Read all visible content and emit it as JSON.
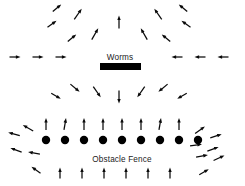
{
  "figure": {
    "width": 245,
    "height": 186,
    "background_color": "#ffffff",
    "ink_color": "#000000"
  },
  "labels": {
    "worms": "Worms",
    "obstacle_fence": "Obstacle Fence"
  },
  "worms_bar": {
    "name": "worms-bar",
    "x": 100,
    "y": 63,
    "width": 41,
    "height": 7,
    "color": "#000000"
  },
  "worms_label_pos": {
    "x": 120,
    "y": 60
  },
  "fence": {
    "label_pos": {
      "x": 122,
      "y": 162
    },
    "dot_radius": 4.2,
    "dot_y": 140,
    "dot_color": "#000000",
    "dot_count": 9,
    "dot_x": [
      46,
      65,
      84,
      103,
      122,
      141,
      160,
      179,
      198
    ]
  },
  "vectors": {
    "arrow_head_length": 4.6,
    "arrow_head_width": 3.4,
    "worms_field": [
      {
        "x": 15,
        "y": 57,
        "angle": 0,
        "len": 11
      },
      {
        "x": 38,
        "y": 57,
        "angle": 0,
        "len": 11
      },
      {
        "x": 61,
        "y": 57,
        "angle": 0,
        "len": 11
      },
      {
        "x": 177,
        "y": 57,
        "angle": 180,
        "len": 11
      },
      {
        "x": 200,
        "y": 57,
        "angle": 180,
        "len": 11
      },
      {
        "x": 223,
        "y": 57,
        "angle": 180,
        "len": 11
      },
      {
        "x": 119,
        "y": 22,
        "angle": 90,
        "len": 13
      },
      {
        "x": 95,
        "y": 34,
        "angle": 60,
        "len": 13
      },
      {
        "x": 144,
        "y": 34,
        "angle": 120,
        "len": 13
      },
      {
        "x": 72,
        "y": 38,
        "angle": 40,
        "len": 11
      },
      {
        "x": 166,
        "y": 38,
        "angle": 140,
        "len": 11
      },
      {
        "x": 78,
        "y": 14,
        "angle": 55,
        "len": 13
      },
      {
        "x": 158,
        "y": 14,
        "angle": 125,
        "len": 13
      },
      {
        "x": 52,
        "y": 24,
        "angle": 35,
        "len": 11
      },
      {
        "x": 186,
        "y": 24,
        "angle": 145,
        "len": 11
      },
      {
        "x": 183,
        "y": 8,
        "angle": 140,
        "len": 11
      },
      {
        "x": 57,
        "y": 8,
        "angle": 40,
        "len": 11
      },
      {
        "x": 119,
        "y": 97,
        "angle": -90,
        "len": 13
      },
      {
        "x": 97,
        "y": 92,
        "angle": -55,
        "len": 13
      },
      {
        "x": 141,
        "y": 92,
        "angle": -125,
        "len": 13
      },
      {
        "x": 75,
        "y": 88,
        "angle": -40,
        "len": 12
      },
      {
        "x": 163,
        "y": 88,
        "angle": -140,
        "len": 12
      },
      {
        "x": 56,
        "y": 96,
        "angle": -30,
        "len": 11
      },
      {
        "x": 182,
        "y": 96,
        "angle": -150,
        "len": 11
      }
    ],
    "fence_field": [
      {
        "x": 46,
        "y": 124,
        "angle": 90,
        "len": 12
      },
      {
        "x": 65,
        "y": 124,
        "angle": 80,
        "len": 12
      },
      {
        "x": 84,
        "y": 124,
        "angle": 90,
        "len": 12
      },
      {
        "x": 103,
        "y": 124,
        "angle": 90,
        "len": 12
      },
      {
        "x": 122,
        "y": 124,
        "angle": 90,
        "len": 12
      },
      {
        "x": 141,
        "y": 124,
        "angle": 90,
        "len": 12
      },
      {
        "x": 160,
        "y": 124,
        "angle": 80,
        "len": 12
      },
      {
        "x": 179,
        "y": 124,
        "angle": 90,
        "len": 12
      },
      {
        "x": 28,
        "y": 128,
        "angle": 150,
        "len": 12
      },
      {
        "x": 14,
        "y": 134,
        "angle": 165,
        "len": 12
      },
      {
        "x": 200,
        "y": 130,
        "angle": 35,
        "len": 12
      },
      {
        "x": 216,
        "y": 136,
        "angle": 18,
        "len": 12
      },
      {
        "x": 196,
        "y": 145,
        "angle": 8,
        "len": 12
      },
      {
        "x": 213,
        "y": 149,
        "angle": 20,
        "len": 12
      },
      {
        "x": 34,
        "y": 153,
        "angle": 170,
        "len": 12
      },
      {
        "x": 16,
        "y": 150,
        "angle": 160,
        "len": 12
      },
      {
        "x": 202,
        "y": 156,
        "angle": 10,
        "len": 12
      },
      {
        "x": 219,
        "y": 158,
        "angle": 25,
        "len": 12
      },
      {
        "x": 36,
        "y": 170,
        "angle": 145,
        "len": 11
      },
      {
        "x": 60,
        "y": 173,
        "angle": 90,
        "len": 11
      },
      {
        "x": 82,
        "y": 173,
        "angle": 90,
        "len": 11
      },
      {
        "x": 104,
        "y": 173,
        "angle": 90,
        "len": 11
      },
      {
        "x": 126,
        "y": 173,
        "angle": 90,
        "len": 11
      },
      {
        "x": 148,
        "y": 173,
        "angle": 90,
        "len": 11
      },
      {
        "x": 170,
        "y": 173,
        "angle": 90,
        "len": 11
      },
      {
        "x": 204,
        "y": 172,
        "angle": 30,
        "len": 11
      }
    ]
  }
}
